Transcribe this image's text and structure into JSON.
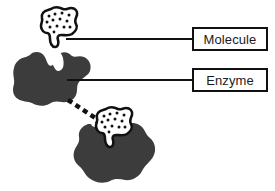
{
  "diagram": {
    "background_color": "#ffffff",
    "callouts": [
      {
        "id": "molecule",
        "label": "Molecule",
        "box": {
          "x": 192,
          "y": 27,
          "width": 76,
          "height": 24
        },
        "border_color": "#111111",
        "fill_color": "#ffffff",
        "text_color": "#1b1b1b",
        "leader_line": {
          "x1": 66,
          "y1": 39,
          "x2": 192,
          "y2": 39,
          "color": "#111111",
          "width": 2
        }
      },
      {
        "id": "enzyme",
        "label": "Enzyme",
        "box": {
          "x": 192,
          "y": 68,
          "width": 76,
          "height": 24
        },
        "border_color": "#111111",
        "fill_color": "#ffffff",
        "text_color": "#1b1b1b",
        "leader_line": {
          "x1": 67,
          "y1": 80,
          "x2": 192,
          "y2": 80,
          "color": "#111111",
          "width": 2
        }
      }
    ],
    "shapes": {
      "molecule_top": {
        "name": "molecule-blob-top",
        "fill_color": "#ffffff",
        "outline_color": "#111111",
        "speckle_color": "#111111",
        "speckle_count": 12,
        "center": {
          "x": 60,
          "y": 26
        }
      },
      "enzyme_top": {
        "name": "enzyme-blob-top",
        "fill_color": "#3c3c3c",
        "outline_color": "#3c3c3c",
        "center": {
          "x": 58,
          "y": 78
        }
      },
      "molecule_bottom": {
        "name": "molecule-blob-bottom",
        "fill_color": "#ffffff",
        "outline_color": "#111111",
        "speckle_color": "#111111",
        "speckle_count": 12,
        "center": {
          "x": 114,
          "y": 126
        }
      },
      "enzyme_bottom": {
        "name": "enzyme-blob-bottom",
        "fill_color": "#3c3c3c",
        "outline_color": "#3c3c3c",
        "center": {
          "x": 116,
          "y": 155
        }
      },
      "binding_arrow": {
        "name": "dashed-binding-arrow",
        "color": "#111111",
        "style": "dashed",
        "from": {
          "x": 70,
          "y": 101
        },
        "to": {
          "x": 103,
          "y": 123
        }
      }
    }
  }
}
